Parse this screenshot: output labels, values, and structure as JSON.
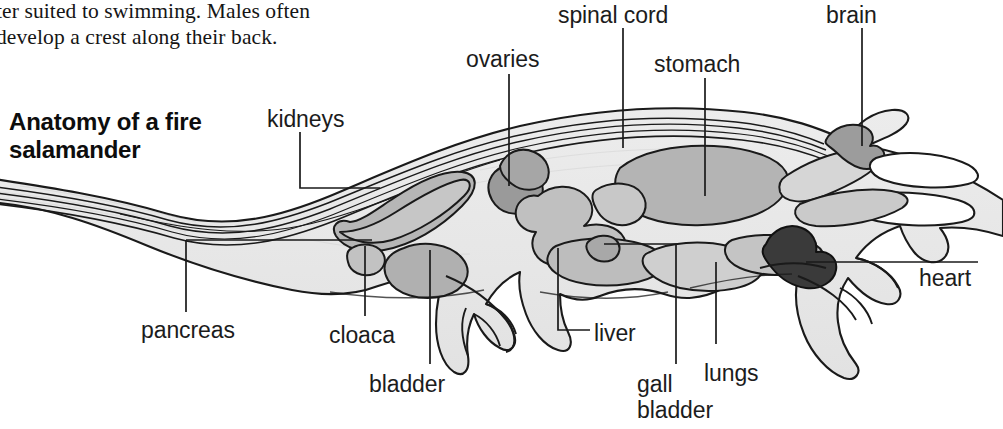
{
  "page": {
    "width": 1003,
    "height": 429,
    "background": "#ffffff"
  },
  "body_text": {
    "content": "ter suited to swimming. Males often\ndevelop a crest along their back.",
    "note_clipped_left": true
  },
  "diagram": {
    "title": "Anatomy of a fire\nsalamander",
    "subject": "fire salamander",
    "view": "lateral cutaway / sagittal section",
    "colors": {
      "body_fill": "#e8e8e8",
      "organ_fill_light": "#d2d2d2",
      "organ_fill_mid": "#b9b9b9",
      "organ_fill_dark": "#9e9e9e",
      "heart_fill": "#3a3a3a",
      "outline": "#1a1a1a",
      "leader_line": "#1a1a1a",
      "text": "#1c1c1c"
    },
    "labels": [
      {
        "id": "spinal-cord",
        "text": "spinal cord",
        "x": 558,
        "y": 2,
        "align": "left"
      },
      {
        "id": "brain",
        "text": "brain",
        "x": 826,
        "y": 2,
        "align": "left"
      },
      {
        "id": "ovaries",
        "text": "ovaries",
        "x": 466,
        "y": 46,
        "align": "left"
      },
      {
        "id": "stomach",
        "text": "stomach",
        "x": 654,
        "y": 51,
        "align": "left"
      },
      {
        "id": "kidneys",
        "text": "kidneys",
        "x": 267,
        "y": 106,
        "align": "left"
      },
      {
        "id": "heart",
        "text": "heart",
        "x": 919,
        "y": 265,
        "align": "left"
      },
      {
        "id": "pancreas",
        "text": "pancreas",
        "x": 141,
        "y": 317,
        "align": "left"
      },
      {
        "id": "cloaca",
        "text": "cloaca",
        "x": 329,
        "y": 322,
        "align": "left"
      },
      {
        "id": "liver",
        "text": "liver",
        "x": 594,
        "y": 320,
        "align": "left"
      },
      {
        "id": "lungs",
        "text": "lungs",
        "x": 704,
        "y": 360,
        "align": "left"
      },
      {
        "id": "bladder",
        "text": "bladder",
        "x": 369,
        "y": 371,
        "align": "left"
      },
      {
        "id": "gall-bladder",
        "text": "gall\nbladder",
        "x": 637,
        "y": 371,
        "align": "left"
      }
    ],
    "organ_list": [
      "spinal cord",
      "brain",
      "ovaries",
      "stomach",
      "kidneys",
      "heart",
      "pancreas",
      "cloaca",
      "liver",
      "lungs",
      "bladder",
      "gall bladder"
    ]
  }
}
